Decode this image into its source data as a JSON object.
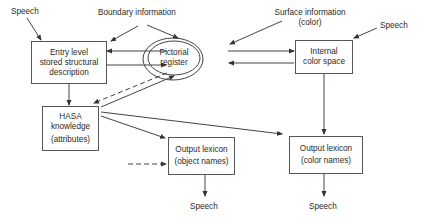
{
  "diagram": {
    "nodes": {
      "entry_level": {
        "line1": "Entry level",
        "line2": "stored structural",
        "line3": "description"
      },
      "pictorial_register": {
        "line1": "Pictorial",
        "line2": "register"
      },
      "internal_color_space": {
        "line1": "Internal",
        "line2": "color space"
      },
      "hasa_knowledge": {
        "line1": "HASA",
        "line2": "knowledge",
        "line3": "(attributes)"
      },
      "output_lexicon_object": {
        "line1": "Output lexicon",
        "line2": "(object names)"
      },
      "output_lexicon_color": {
        "line1": "Output lexicon",
        "line2": "(color names)"
      }
    },
    "inputs": {
      "speech_top_left": "Speech",
      "boundary_information": "Boundary  information",
      "surface_information_line1": "Surface information",
      "surface_information_line2": "(color)",
      "speech_top_right": "Speech"
    },
    "outputs": {
      "speech_object": "Speech",
      "speech_color": "Speech"
    },
    "edges": [
      {
        "from": "speech_top_left",
        "to": "entry_level",
        "style": "solid"
      },
      {
        "from": "boundary_information",
        "to": "entry_level",
        "style": "solid"
      },
      {
        "from": "boundary_information",
        "to": "pictorial_register",
        "style": "solid"
      },
      {
        "from": "surface_information",
        "to": "pictorial_register",
        "style": "solid"
      },
      {
        "from": "speech_top_right",
        "to": "internal_color_space",
        "style": "solid"
      },
      {
        "from": "pictorial_register",
        "to": "entry_level",
        "style": "solid"
      },
      {
        "from": "entry_level",
        "to": "pictorial_register",
        "style": "solid"
      },
      {
        "from": "pictorial_register",
        "to": "internal_color_space",
        "style": "solid"
      },
      {
        "from": "internal_color_space",
        "to": "pictorial_register",
        "style": "solid"
      },
      {
        "from": "entry_level",
        "to": "hasa_knowledge",
        "style": "solid"
      },
      {
        "from": "pictorial_register",
        "to": "hasa_knowledge",
        "style": "dashed"
      },
      {
        "from": "hasa_knowledge",
        "to": "pictorial_register",
        "style": "solid"
      },
      {
        "from": "hasa_knowledge",
        "to": "output_lexicon_object",
        "style": "solid"
      },
      {
        "from": "hasa_knowledge",
        "to": "output_lexicon_color",
        "style": "solid"
      },
      {
        "from": "unlabeled_input",
        "to": "output_lexicon_object",
        "style": "dashed"
      },
      {
        "from": "internal_color_space",
        "to": "output_lexicon_color",
        "style": "solid"
      },
      {
        "from": "output_lexicon_object",
        "to": "speech_object",
        "style": "solid"
      },
      {
        "from": "output_lexicon_color",
        "to": "speech_color",
        "style": "solid"
      }
    ]
  }
}
